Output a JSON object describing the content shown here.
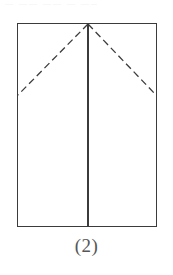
{
  "figure": {
    "caption": "(2)",
    "top_artifact_text": "— —— —— — ——",
    "colors": {
      "background": "#ffffff",
      "stroke": "#3b3b3b",
      "dashed_stroke": "#3b3b3b",
      "caption_text": "#565656",
      "artifact_text": "#f2f2f2"
    },
    "geometry": {
      "canvas_width": 173,
      "canvas_height": 275,
      "rect_left": 17,
      "rect_top": 23,
      "rect_right": 157,
      "rect_bottom": 227,
      "rect_width": 140,
      "rect_height": 204,
      "apex_x": 88,
      "apex_y": 24,
      "fold_left_end_x": 18,
      "fold_left_end_y": 95,
      "fold_right_end_x": 156,
      "fold_right_end_y": 95,
      "center_line_x": 88,
      "center_line_top_y": 23,
      "center_line_bottom_y": 227,
      "solid_stroke_width": 1.1,
      "dash_stroke_width": 1.3,
      "dash_pattern": "7 4"
    },
    "elements": {
      "outer_rectangle_name": "paper-outline-rectangle",
      "center_line_name": "center-fold-line",
      "left_dashed_name": "left-fold-dashed-line",
      "right_dashed_name": "right-fold-dashed-line"
    }
  }
}
